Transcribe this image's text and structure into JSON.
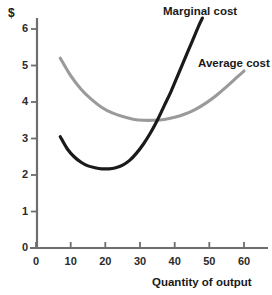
{
  "chart_data": {
    "type": "line",
    "title": "",
    "xlabel": "Quantity of output",
    "ylabel": "$",
    "xlim": [
      0,
      67
    ],
    "ylim": [
      0,
      6.6
    ],
    "xticks": [
      0,
      10,
      20,
      30,
      40,
      50,
      60
    ],
    "yticks": [
      0,
      1,
      2,
      3,
      4,
      5,
      6
    ],
    "xtick_labels": [
      "0",
      "10",
      "20",
      "30",
      "40",
      "50",
      "60"
    ],
    "ytick_labels": [
      "0",
      "1",
      "2",
      "3",
      "4",
      "5",
      "6"
    ],
    "grid": false,
    "legend_position": "inline-annotations",
    "series": [
      {
        "name": "Marginal cost",
        "color": "#1a1a1a",
        "label_x": 48,
        "label_y": 6.5,
        "x": [
          7,
          9,
          11,
          13,
          15,
          17,
          19,
          21,
          23,
          25,
          27,
          29,
          31,
          33,
          35,
          37,
          39,
          41,
          43,
          45,
          47,
          48
        ],
        "y": [
          3.05,
          2.72,
          2.5,
          2.35,
          2.25,
          2.2,
          2.17,
          2.17,
          2.2,
          2.27,
          2.4,
          2.6,
          2.85,
          3.15,
          3.5,
          3.9,
          4.3,
          4.75,
          5.2,
          5.65,
          6.1,
          6.3
        ]
      },
      {
        "name": "Average cost",
        "color": "#9a9a9a",
        "label_x": 48,
        "label_y": 5.15,
        "x": [
          7,
          10,
          13,
          16,
          19,
          22,
          25,
          28,
          31,
          34,
          37,
          40,
          43,
          46,
          49,
          52,
          55,
          58,
          60
        ],
        "y": [
          5.2,
          4.72,
          4.35,
          4.07,
          3.85,
          3.7,
          3.6,
          3.53,
          3.5,
          3.5,
          3.52,
          3.58,
          3.67,
          3.8,
          3.97,
          4.18,
          4.42,
          4.68,
          4.85
        ]
      }
    ],
    "annotations": [
      {
        "text": "Marginal cost",
        "series": "Marginal cost"
      },
      {
        "text": "Average cost",
        "series": "Average cost"
      }
    ]
  },
  "axes": {
    "y_unit_symbol": "$",
    "x_axis_title": "Quantity of output"
  },
  "labels": {
    "marginal_cost": "Marginal cost",
    "average_cost": "Average cost",
    "y0": "0",
    "y1": "1",
    "y2": "2",
    "y3": "3",
    "y4": "4",
    "y5": "5",
    "y6": "6",
    "x0": "0",
    "x10": "10",
    "x20": "20",
    "x30": "30",
    "x40": "40",
    "x50": "50",
    "x60": "60"
  },
  "colors": {
    "marginal_cost_line": "#1a1a1a",
    "average_cost_line": "#9a9a9a",
    "axis": "#6e6e6e",
    "text": "#1a1a1a",
    "background": "#ffffff"
  }
}
